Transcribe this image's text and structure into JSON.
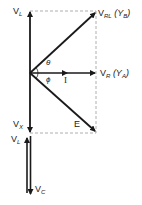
{
  "diagram": {
    "type": "phasor-diagram",
    "labels": {
      "vl_top": {
        "main": "V",
        "sub": "L"
      },
      "vrl": {
        "main": "V",
        "sub": "RL",
        "extra": "(Y",
        "extra_sub": "B",
        "extra_end": ")"
      },
      "theta": "θ",
      "phi": "ϕ",
      "current": "I",
      "vr": {
        "main": "V",
        "sub": "R",
        "extra": "(Y",
        "extra_sub": "A",
        "extra_end": ")"
      },
      "e": "E",
      "vx": {
        "main": "V",
        "sub": "X"
      },
      "vl_bottom": {
        "main": "V",
        "sub": "L"
      },
      "vc": {
        "main": "V",
        "sub": "C"
      }
    },
    "colors": {
      "stroke": "#1a1a1a",
      "dash": "#9a9a9a"
    }
  }
}
